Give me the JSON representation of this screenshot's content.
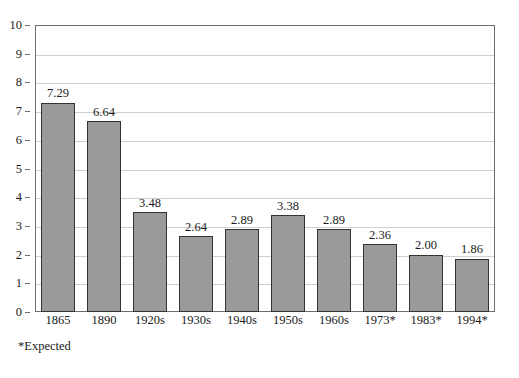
{
  "chart_data": {
    "type": "bar",
    "title": "",
    "subtitle": "",
    "xlabel": "",
    "ylabel": "",
    "ylim": [
      0,
      10
    ],
    "ytick_step": 1,
    "yticks": [
      "0",
      "1",
      "2",
      "3",
      "4",
      "5",
      "6",
      "7",
      "8",
      "9",
      "10"
    ],
    "grid": true,
    "grid_axis": "y",
    "legend": false,
    "legend_position": "none",
    "categories": [
      "1865",
      "1890",
      "1920s",
      "1930s",
      "1940s",
      "1950s",
      "1960s",
      "1973*",
      "1983*",
      "1994*"
    ],
    "values": [
      7.29,
      6.64,
      3.48,
      2.64,
      2.89,
      3.38,
      2.89,
      2.36,
      2.0,
      1.86
    ],
    "data_labels": [
      "7.29",
      "6.64",
      "3.48",
      "2.64",
      "2.89",
      "3.38",
      "2.89",
      "2.36",
      "2.00",
      "1.86"
    ],
    "annotations": [
      "*Expected"
    ]
  },
  "footnote": "*Expected",
  "colors": {
    "bar_fill": "#9a9a9a",
    "bar_border": "#333333",
    "gridline": "#cfcfcf",
    "frame": "#6e6e6e",
    "background": "#ffffff",
    "text": "#1a1a1a"
  }
}
